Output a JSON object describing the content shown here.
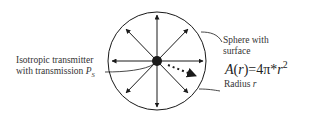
{
  "diagram": {
    "transmitter_label": {
      "line1": "Isotropic transmitter",
      "line2": "with transmission",
      "symbol": "P",
      "subscript": "S"
    },
    "sphere_label": {
      "line1": "Sphere with",
      "line2": "surface"
    },
    "formula": {
      "lhs_func": "A",
      "lhs_arg": "r",
      "rhs": "=4π*",
      "var": "r",
      "exponent": "2"
    },
    "radius_label": {
      "text": "Radius",
      "symbol": "r"
    },
    "colors": {
      "stroke": "#1a1a1a",
      "text": "#333333"
    },
    "arrow_directions": [
      "up",
      "up-right",
      "right",
      "down-right",
      "down",
      "down-left",
      "left",
      "up-left"
    ]
  }
}
